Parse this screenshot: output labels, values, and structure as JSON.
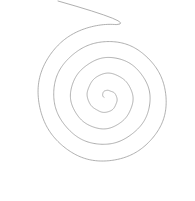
{
  "canvas": {
    "width": 195,
    "height": 201,
    "background_color": "#ffffff",
    "title": "Spiral line drawing"
  },
  "drawing": {
    "type": "archimedean-spiral",
    "name": "spiral",
    "stroke_color": "#9a9a9a",
    "stroke_width": 0.8,
    "center_x": 106,
    "center_y": 97,
    "inner_radius": 2.0,
    "outer_radius": 72.5,
    "turns": 4.3,
    "start_angle_deg": -10,
    "direction": "counter-clockwise-outward",
    "tail_end_x": 58,
    "tail_end_y": 1,
    "wobble_amplitude": 0.9,
    "sample_points": 1100
  },
  "chart_data": {
    "type": "line",
    "xlabel": "",
    "ylabel": "",
    "xlim": [
      0,
      195
    ],
    "ylim": [
      0,
      201
    ],
    "grid": false,
    "legend": "none",
    "series": [
      {
        "name": "spiral",
        "equation": "r = a + b*theta",
        "a": 2.0,
        "b": 2.61,
        "theta_range_deg": [
          0,
          1548
        ],
        "center": [
          106,
          97
        ],
        "radius_samples": [
          2.0,
          13.5,
          25.0,
          36.5,
          48.0,
          59.5,
          71.0
        ],
        "crossings_right_of_center_x": [
          120,
          138,
          163,
          178
        ],
        "crossings_left_of_center_x": [
          88,
          74,
          47,
          13
        ],
        "crossings_above_center_y": [
          90,
          78,
          57,
          30
        ],
        "crossings_below_center_y": [
          100,
          112,
          133,
          182
        ]
      }
    ]
  }
}
